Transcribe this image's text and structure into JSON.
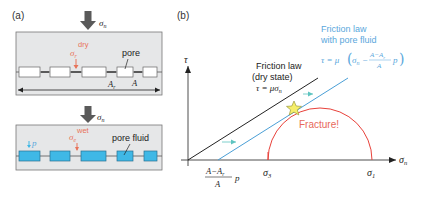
{
  "panel_a": {
    "label": "(a)",
    "dry": {
      "applied_stress": "σ",
      "applied_stress_sub": "n",
      "local_stress": "σ",
      "local_stress_sub": "r",
      "local_stress_sup": "dry",
      "pore_label": "pore",
      "contact_area_label": "A",
      "contact_area_sub": "r",
      "total_area_label": "A"
    },
    "wet": {
      "applied_stress": "σ",
      "applied_stress_sub": "n",
      "local_stress": "σ",
      "local_stress_sub": "e",
      "local_stress_sup": "wet",
      "pressure_label": "p",
      "pore_label": "pore fluid"
    }
  },
  "panel_b": {
    "label": "(b)",
    "y_axis_label": "τ",
    "x_axis_label": "σ",
    "x_axis_sub": "n",
    "dry_law": {
      "title_line1": "Friction law",
      "title_line2": "(dry state)",
      "equation": "τ = μσ",
      "equation_sub": "n"
    },
    "wet_law": {
      "title_line1": "Friction law",
      "title_line2": "with pore fluid",
      "eq_prefix": "τ = μ",
      "eq_sigma": "σ",
      "eq_sigma_sub": "n",
      "eq_minus": "−",
      "eq_frac_num": "A−A",
      "eq_frac_num_sub": "r",
      "eq_frac_den": "A",
      "eq_p": "p"
    },
    "intercept": {
      "frac_num": "A−A",
      "frac_num_sub": "r",
      "frac_den": "A",
      "p": "p"
    },
    "sigma3": "σ",
    "sigma3_sub": "3",
    "sigma1": "σ",
    "sigma1_sub": "1",
    "fracture_label": "Fracture!"
  },
  "colors": {
    "gray_fill": "#e6e7e8",
    "box_border": "#5a5a5a",
    "orange_red": "#e8745a",
    "blue_fluid": "#3fb8e6",
    "blue_line": "#4a9fd6",
    "blue_text": "#5aa7dc",
    "red_circle": "#e8413a",
    "fracture_text": "#e8685a",
    "star_fill": "#f5ee6a",
    "teal_arrow": "#5ec4c0",
    "black": "#222222",
    "arrow_gray": "#5a5a5a"
  }
}
